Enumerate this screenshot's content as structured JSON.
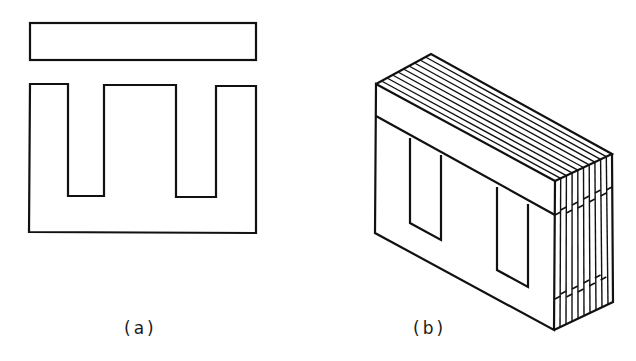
{
  "figure": {
    "panels": [
      {
        "id": "a",
        "label": "(a)",
        "content": "I-lamination (top bar) and E-lamination (flat view)"
      },
      {
        "id": "b",
        "label": "(b)",
        "content": "Stacked laminations forming core (isometric view)"
      }
    ],
    "line_color": "#111111",
    "background_color": "#ffffff",
    "lamination_count": 10
  }
}
